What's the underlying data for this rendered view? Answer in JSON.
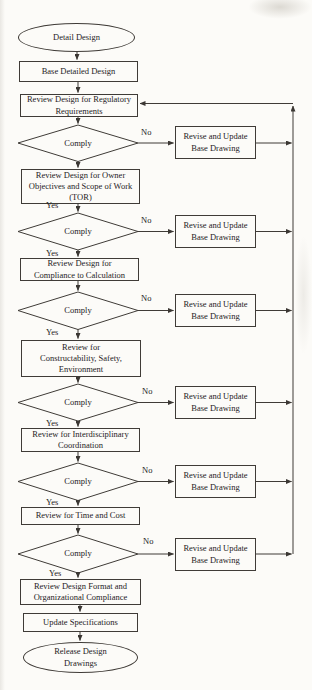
{
  "flowchart": {
    "nodes": {
      "start": "Detail Design",
      "base": "Base Detailed Design",
      "regulatory": "Review Design for Regulatory\nRequirements",
      "owner": "Review Design for Owner\nObjectives and Scope of Work\n(TOR)",
      "calc": "Review Design for\nCompliance to Calculation",
      "construct": "Review for\nConstructability, Safety,\nEnvironment",
      "interdisc": "Review for Interdisciplinary\nCoordination",
      "timecost": "Review for Time and Cost",
      "format": "Review Design Format and\nOrganizational Compliance",
      "specs": "Update Specifications",
      "release": "Release Design\nDrawings"
    },
    "decision_label": "Comply",
    "revise_label": "Revise and Update\nBase Drawing",
    "yes_label": "Yes",
    "no_label": "No",
    "colors": {
      "line": "#3f3b37",
      "text": "#26221e",
      "paper": "#fcfbf8"
    }
  }
}
